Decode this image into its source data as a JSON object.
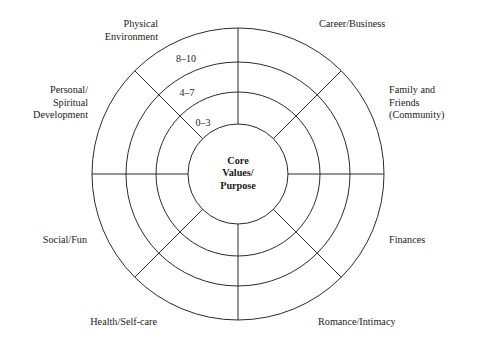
{
  "diagram": {
    "name": "Wheel of Life",
    "type": "radial-wheel",
    "background_color": "#ffffff",
    "line_color": "#2b2b2b",
    "text_color": "#1a1a1a",
    "center": {
      "label": "Core\nValues/\nPurpose",
      "radius_px": 50
    },
    "rings": [
      {
        "label": "0–3",
        "outer_radius_px": 82,
        "inner_radius_px": 50
      },
      {
        "label": "4–7",
        "outer_radius_px": 112,
        "inner_radius_px": 82
      },
      {
        "label": "8–10",
        "outer_radius_px": 146,
        "inner_radius_px": 112
      }
    ],
    "ring_label_positions": [
      {
        "label": "0–3",
        "x": 203,
        "y": 122
      },
      {
        "label": "4–7",
        "x": 187,
        "y": 92
      },
      {
        "label": "8–10",
        "x": 186,
        "y": 58
      }
    ],
    "segments": [
      {
        "label": "Career/Business",
        "angle_deg": 22.5,
        "label_x": 319,
        "label_y": 18,
        "align": "left"
      },
      {
        "label": "Family and\nFriends\n(Community)",
        "angle_deg": 337.5,
        "label_x": 389,
        "label_y": 84,
        "align": "left"
      },
      {
        "label": "Finances",
        "angle_deg": 292.5,
        "label_x": 389,
        "label_y": 234,
        "align": "left"
      },
      {
        "label": "Romance/Intimacy",
        "angle_deg": 247.5,
        "label_x": 318,
        "label_y": 316,
        "align": "left"
      },
      {
        "label": "Health/Self-care",
        "angle_deg": 202.5,
        "label_x": 157,
        "label_y": 316,
        "align": "right"
      },
      {
        "label": "Social/Fun",
        "angle_deg": 157.5,
        "label_x": 87,
        "label_y": 234,
        "align": "right"
      },
      {
        "label": "Personal/\nSpiritual\nDevelopment",
        "angle_deg": 112.5,
        "label_x": 88,
        "label_y": 84,
        "align": "right"
      },
      {
        "label": "Physical\nEnvironment",
        "angle_deg": 67.5,
        "label_x": 158,
        "label_y": 18,
        "align": "right"
      }
    ]
  }
}
